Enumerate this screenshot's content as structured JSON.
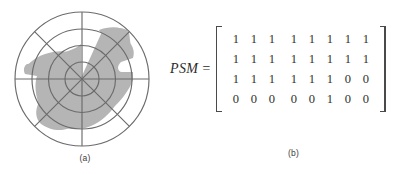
{
  "figure": {
    "panel_a": {
      "caption": "(a)",
      "type": "polar-coverage-plot",
      "ring_count": 4,
      "spoke_count": 8,
      "colors": {
        "grid_line": "#6b6b6b",
        "shaded_region": "#b5b5b5",
        "background": "#ffffff"
      },
      "shaded_region_name": "coverage-region"
    },
    "panel_b": {
      "caption": "(b)",
      "matrix_label": "PSM",
      "equals": "=",
      "matrix": [
        [
          "1",
          "1",
          "1",
          "1",
          "1",
          "1",
          "1",
          "1"
        ],
        [
          "1",
          "1",
          "1",
          "1",
          "1",
          "1",
          "1",
          "1"
        ],
        [
          "1",
          "1",
          "1",
          "1",
          "1",
          "1",
          "0",
          "0"
        ],
        [
          "0",
          "0",
          "0",
          "0",
          "0",
          "1",
          "0",
          "0"
        ]
      ],
      "rows": 4,
      "columns": 8,
      "colors": {
        "digit": "#2f2f2f",
        "bracket": "#4a4a4a"
      }
    }
  }
}
